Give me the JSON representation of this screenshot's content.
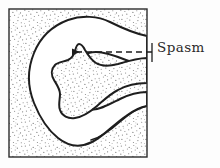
{
  "figure": {
    "kind": "hand-drawn-anatomical-diagram",
    "title": "Spasm",
    "background_color": "#fdfdfd",
    "frame": {
      "name": "specimen-frame",
      "x": 9,
      "y": 9,
      "width": 138,
      "height": 148,
      "stroke_color": "#2b2b2b",
      "stroke_width": 1.4,
      "fill_description": "stippled-gray-texture",
      "stipple_color": "#8c8c8c",
      "stipple_density": "medium-fine"
    },
    "lumen": {
      "name": "lumen-region",
      "fill_color": "#ffffff",
      "stroke_color": "#1e1e1e",
      "stroke_width": 2.0,
      "description": "irregular C-shaped white lumen"
    },
    "peninsula": {
      "name": "spasm-peninsula",
      "fill_description": "stippled-gray-texture",
      "stroke_color": "#1e1e1e",
      "stroke_width": 2.0,
      "description": "stippled tissue protrusion intruding into lumen from the right wall"
    },
    "annotation": {
      "label": "Spasm",
      "label_color": "#2a2a2a",
      "leader_line": {
        "name": "leader-line",
        "style": "dashed",
        "color": "#1e1e1e",
        "x_start": 152,
        "x_end": 72,
        "y": 52,
        "dash_pattern": "6 4"
      },
      "arrowhead": {
        "name": "arrowhead",
        "direction": "left",
        "tip_x": 67,
        "tip_y": 52,
        "color": "#1e1e1e"
      },
      "tick": {
        "name": "leader-tick",
        "x": 152,
        "y_top": 43,
        "y_bottom": 62
      }
    }
  }
}
